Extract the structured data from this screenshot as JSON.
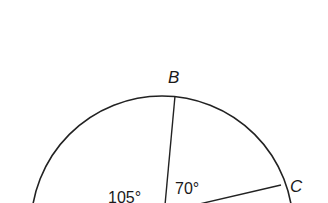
{
  "diagram": {
    "type": "circle-with-central-angles",
    "points": [
      {
        "name": "B",
        "label": "B"
      },
      {
        "name": "C",
        "label": "C"
      }
    ],
    "angles": [
      {
        "name": "angle-left-of-B",
        "label": "105°",
        "degrees": 105
      },
      {
        "name": "angle-BOC",
        "label": "70°",
        "degrees": 70
      }
    ],
    "colors": {
      "line": "#222222",
      "text": "#1a1a1a",
      "background": "#ffffff"
    }
  }
}
